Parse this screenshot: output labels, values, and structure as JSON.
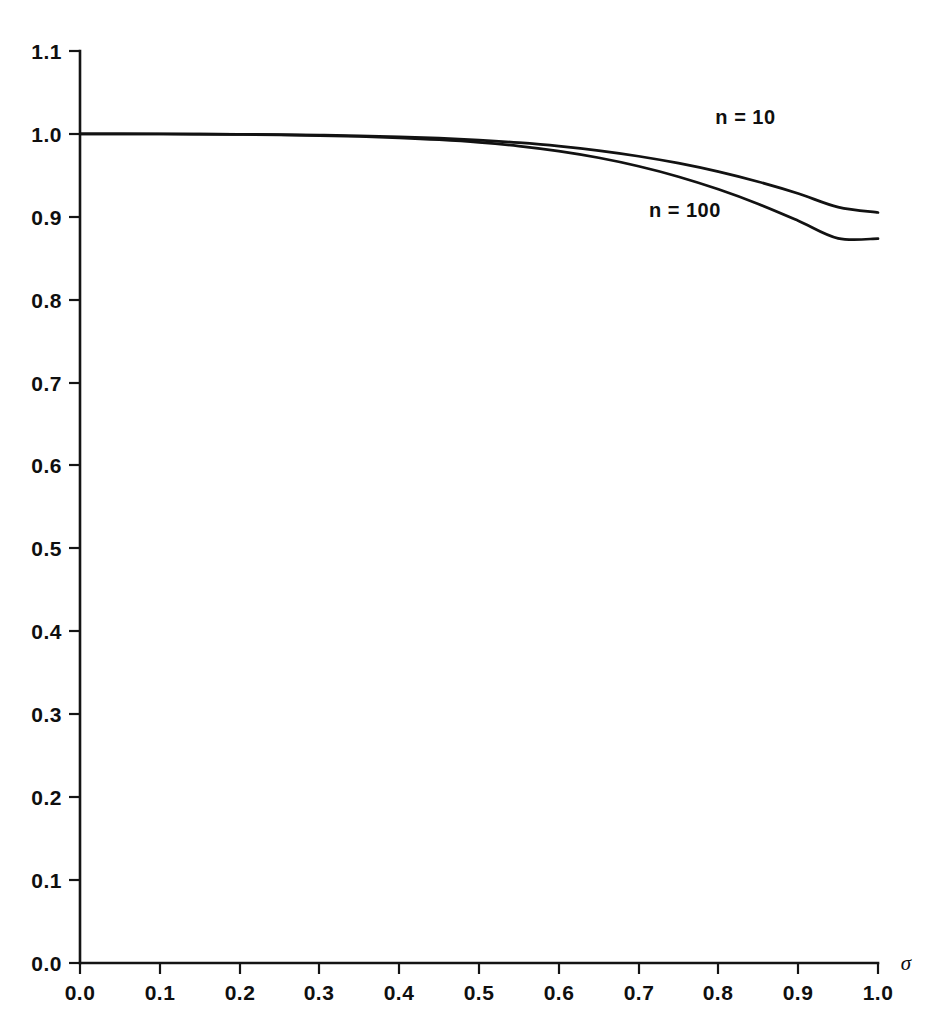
{
  "chart_data": {
    "type": "line",
    "title": "",
    "subtitle": "",
    "xlabel": "σ",
    "ylabel": "",
    "xlim": [
      0.0,
      1.0
    ],
    "ylim": [
      0.0,
      1.1
    ],
    "grid": false,
    "legend_position": "inline-annotations",
    "x_ticks": [
      "0.0",
      "0.1",
      "0.2",
      "0.3",
      "0.4",
      "0.5",
      "0.6",
      "0.7",
      "0.8",
      "0.9",
      "1.0"
    ],
    "y_ticks": [
      "0.0",
      "0.1",
      "0.2",
      "0.3",
      "0.4",
      "0.5",
      "0.6",
      "0.7",
      "0.8",
      "0.9",
      "1.0",
      "1.1"
    ],
    "x": [
      0.0,
      0.05,
      0.1,
      0.15,
      0.2,
      0.25,
      0.3,
      0.35,
      0.4,
      0.45,
      0.5,
      0.55,
      0.6,
      0.65,
      0.7,
      0.75,
      0.8,
      0.85,
      0.9,
      0.95,
      1.0
    ],
    "series": [
      {
        "name": "n = 10",
        "label": "n = 10",
        "label_x": 0.834,
        "label_y": 1.012,
        "color": "#121212",
        "values": [
          1.0,
          1.0,
          1.0,
          0.9998,
          0.9995,
          0.9991,
          0.9985,
          0.9977,
          0.9965,
          0.9948,
          0.9925,
          0.9894,
          0.9853,
          0.9799,
          0.9731,
          0.9647,
          0.9545,
          0.9423,
          0.9281,
          0.9117,
          0.9052
        ]
      },
      {
        "name": "n = 100",
        "label": "n = 100",
        "label_x": 0.758,
        "label_y": 0.9,
        "color": "#121212",
        "values": [
          1.0,
          1.0,
          0.9999,
          0.9997,
          0.9993,
          0.9988,
          0.998,
          0.9969,
          0.9953,
          0.993,
          0.9898,
          0.9853,
          0.9792,
          0.9712,
          0.961,
          0.9484,
          0.9332,
          0.9155,
          0.8953,
          0.874,
          0.8737
        ]
      }
    ],
    "annotations": [
      {
        "name": "series-label-n10",
        "text": "n = 10"
      },
      {
        "name": "series-label-n100",
        "text": "n = 100"
      }
    ]
  },
  "axes": {
    "x_axis_name": "x-axis",
    "y_axis_name": "y-axis",
    "sigma_symbol": "σ"
  }
}
